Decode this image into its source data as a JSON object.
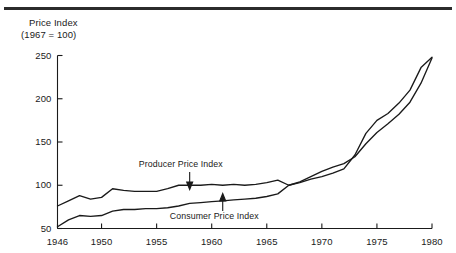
{
  "figure": {
    "has_top_rule": true,
    "background_color": "#ffffff",
    "line_color": "#1a1a1a"
  },
  "chart_data": {
    "type": "line",
    "title": "",
    "subtitle": "",
    "axis_title_lines": [
      "Price Index",
      "(1967 = 100)"
    ],
    "ylabel": "Price Index (1967 = 100)",
    "xlabel": "",
    "grid": false,
    "legend_position": "inline-annotations",
    "xlim": [
      1946,
      1980
    ],
    "ylim": [
      50,
      250
    ],
    "yticks": [
      50,
      100,
      150,
      200,
      250
    ],
    "ytick_labels": [
      "50",
      "100",
      "150",
      "200",
      "250"
    ],
    "xticks": [
      1946,
      1950,
      1955,
      1960,
      1965,
      1970,
      1975,
      1980
    ],
    "xtick_labels": [
      "1946",
      "1950",
      "1955",
      "1960",
      "1965",
      "1970",
      "1975",
      "1980"
    ],
    "annotations": [
      {
        "text": "Producer Price Index",
        "series": "Producer Price Index",
        "arrow_direction": "down",
        "points_at_year": 1958
      },
      {
        "text": "Consumer Price Index",
        "series": "Consumer Price Index",
        "arrow_direction": "up",
        "points_at_year": 1961
      }
    ],
    "x": [
      1946,
      1947,
      1948,
      1949,
      1950,
      1951,
      1952,
      1953,
      1954,
      1955,
      1956,
      1957,
      1958,
      1959,
      1960,
      1961,
      1962,
      1963,
      1964,
      1965,
      1966,
      1967,
      1968,
      1969,
      1970,
      1971,
      1972,
      1973,
      1974,
      1975,
      1976,
      1977,
      1978,
      1979,
      1980
    ],
    "series": [
      {
        "name": "Producer Price Index",
        "values": [
          76,
          82,
          88,
          84,
          86,
          96,
          94,
          93,
          93,
          93,
          96,
          100,
          100,
          100,
          101,
          100,
          101,
          100,
          101,
          103,
          106,
          100,
          103,
          107,
          110,
          114,
          119,
          135,
          160,
          175,
          183,
          195,
          210,
          236,
          248
        ]
      },
      {
        "name": "Consumer Price Index",
        "values": [
          52,
          60,
          65,
          64,
          65,
          70,
          72,
          72,
          73,
          73,
          74,
          76,
          79,
          80,
          81,
          82,
          83,
          84,
          85,
          87,
          90,
          100,
          104,
          110,
          116,
          121,
          125,
          133,
          148,
          161,
          171,
          182,
          196,
          218,
          247
        ]
      }
    ]
  }
}
